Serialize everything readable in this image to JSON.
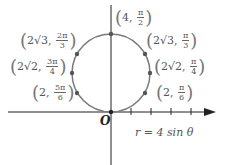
{
  "diagram": {
    "equation": "r = 4 sin θ",
    "origin_label": "O",
    "circle_color": "#7a7a7a",
    "axis_color": "#222222",
    "points": [
      {
        "r": "4",
        "theta_num": "π",
        "theta_den": "2",
        "r_prefix": "4",
        "x": 111,
        "y": 34
      },
      {
        "r": "2√3",
        "theta_num": "π",
        "theta_den": "3",
        "x": 145,
        "y": 54
      },
      {
        "r": "2√2",
        "theta_num": "π",
        "theta_den": "4",
        "x": 150,
        "y": 73
      },
      {
        "r": "2",
        "theta_num": "π",
        "theta_den": "6",
        "x": 145,
        "y": 93
      },
      {
        "r": "2√3",
        "theta_num": "2π",
        "theta_den": "3",
        "x": 77,
        "y": 54
      },
      {
        "r": "2√2",
        "theta_num": "3π",
        "theta_den": "4",
        "x": 72,
        "y": 73
      },
      {
        "r": "2",
        "theta_num": "5π",
        "theta_den": "6",
        "x": 77,
        "y": 93
      }
    ]
  }
}
